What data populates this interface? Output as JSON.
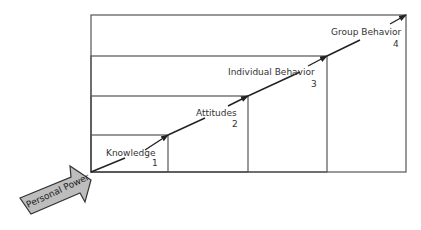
{
  "diagram": {
    "levels": [
      {
        "label": "Knowledge",
        "number": "1"
      },
      {
        "label": "Attitudes",
        "number": "2"
      },
      {
        "label": "Individual Behavior",
        "number": "3"
      },
      {
        "label": "Group Behavior",
        "number": "4"
      }
    ],
    "input_arrow": {
      "label": "Personal Power",
      "fill": "#bdbdbd"
    },
    "line_color": "#555555"
  }
}
